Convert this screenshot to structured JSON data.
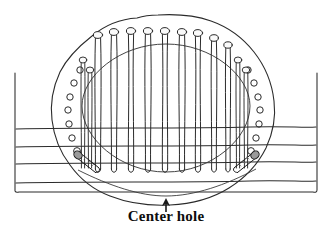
{
  "figure": {
    "type": "technical-line-drawing",
    "title": "",
    "caption": "Center hole",
    "annotation": {
      "label": "Center hole",
      "arrow": "up-arrow-icon",
      "arrow_points_to": "bottom edge of blob outline",
      "arrow_x": 166,
      "arrow_tip_y": 199,
      "arrow_tail_y": 212
    },
    "colors": {
      "ink": "#1a1a1a",
      "line": "#2b2b2b",
      "hatch": "#555555",
      "paper": "#ffffff",
      "pin_fill": "#f2f2f2",
      "pin_shade": "#8a8a8a"
    },
    "elements": {
      "frame": {
        "name": "ruled-frame",
        "description": "open-top rectangular box with four horizontal ruled lines",
        "left_x": 14,
        "right_x": 318,
        "top_y": 72,
        "bottom_y": 192,
        "rule_ys": [
          128,
          146,
          163,
          182
        ]
      },
      "blob": {
        "name": "irregular-blob-outline",
        "description": "hand drawn irregular closed outline (mold/pattern)",
        "center_x": 166,
        "center_y": 110,
        "width": 220,
        "height": 190
      },
      "inner_oval": {
        "name": "inner-oval-outline",
        "description": "inner oval/dome boundary inside the blob",
        "center_x": 166,
        "center_y": 108,
        "rx": 86,
        "ry": 72
      },
      "pins": {
        "name": "vertical-pin",
        "count": 9,
        "description": "vertical pins with round heads at top and rounded tips at bottom",
        "head_radius": 3.4,
        "top_ys": [
          35,
          32,
          31,
          31,
          31,
          32,
          33,
          38,
          45
        ],
        "bottom_y": 172,
        "xs": [
          98,
          114,
          131,
          148,
          165,
          182,
          198,
          214,
          228
        ]
      },
      "side_pins": {
        "name": "side-pin",
        "count": 4,
        "description": "short pins near left and right arcs",
        "items": [
          {
            "x": 83,
            "top_y": 60,
            "bottom_y": 170
          },
          {
            "x": 90,
            "top_y": 70,
            "bottom_y": 170
          },
          {
            "x": 238,
            "top_y": 60,
            "bottom_y": 170
          },
          {
            "x": 246,
            "top_y": 70,
            "bottom_y": 170
          }
        ]
      },
      "diagonal_pins": {
        "name": "diagonal-pin",
        "count": 2,
        "description": "two angled pins with shaded heads at lower left and lower right",
        "items": [
          {
            "head_x": 78,
            "head_y": 155,
            "tip_x": 97,
            "tip_y": 170
          },
          {
            "head_x": 255,
            "head_y": 155,
            "tip_x": 236,
            "tip_y": 170
          }
        ]
      },
      "holes_left": {
        "name": "hole-circle",
        "count": 7,
        "description": "small circular holes in an arc down the left side",
        "points": [
          {
            "x": 80,
            "y": 70,
            "r": 3.2
          },
          {
            "x": 74,
            "y": 83,
            "r": 3.2
          },
          {
            "x": 70,
            "y": 97,
            "r": 3.2
          },
          {
            "x": 68,
            "y": 110,
            "r": 3.2
          },
          {
            "x": 69,
            "y": 124,
            "r": 3.2
          },
          {
            "x": 72,
            "y": 138,
            "r": 3.2
          },
          {
            "x": 77,
            "y": 151,
            "r": 3.4
          }
        ]
      },
      "holes_right": {
        "name": "hole-circle",
        "count": 7,
        "points": [
          {
            "x": 248,
            "y": 70,
            "r": 3.2
          },
          {
            "x": 254,
            "y": 83,
            "r": 3.2
          },
          {
            "x": 258,
            "y": 97,
            "r": 3.2
          },
          {
            "x": 260,
            "y": 110,
            "r": 3.2
          },
          {
            "x": 259,
            "y": 124,
            "r": 3.2
          },
          {
            "x": 256,
            "y": 138,
            "r": 3.2
          },
          {
            "x": 251,
            "y": 151,
            "r": 3.4
          }
        ]
      }
    }
  }
}
